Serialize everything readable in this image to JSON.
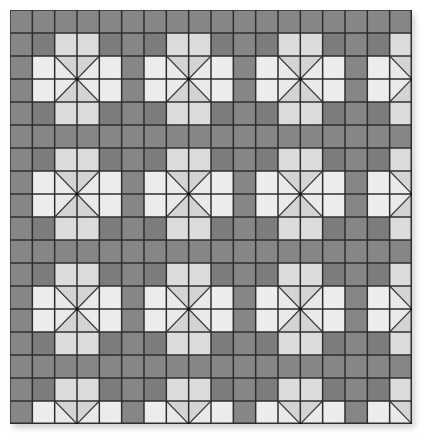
{
  "board": {
    "rows": 18,
    "cols": 18,
    "cell_width": 22.333,
    "cell_height": 23,
    "period": 5,
    "motif_offset": 0,
    "colors": {
      "dark": "#888888",
      "dark_corner": "#7e7e7e",
      "side_light": "#efefef",
      "arm_light": "#dedede",
      "x_vertical_triangle": "#d6d6d6",
      "x_horizontal_triangle": "#ececec",
      "grid_line": "#2e2e2e",
      "diagonal_line": "#3a3a3a"
    },
    "motif_map": [
      [
        "D",
        "D",
        "D",
        "D",
        "D"
      ],
      [
        "D",
        "C",
        "A",
        "A",
        "C"
      ],
      [
        "D",
        "S",
        "X",
        "X",
        "S"
      ],
      [
        "D",
        "S",
        "X",
        "X",
        "S"
      ],
      [
        "D",
        "C",
        "A",
        "A",
        "C"
      ]
    ],
    "legend": {
      "D": "dark cell",
      "C": "dark corner cell",
      "A": "light arm cell",
      "S": "light side cell",
      "X": "quartered center cell with diagonals"
    }
  }
}
